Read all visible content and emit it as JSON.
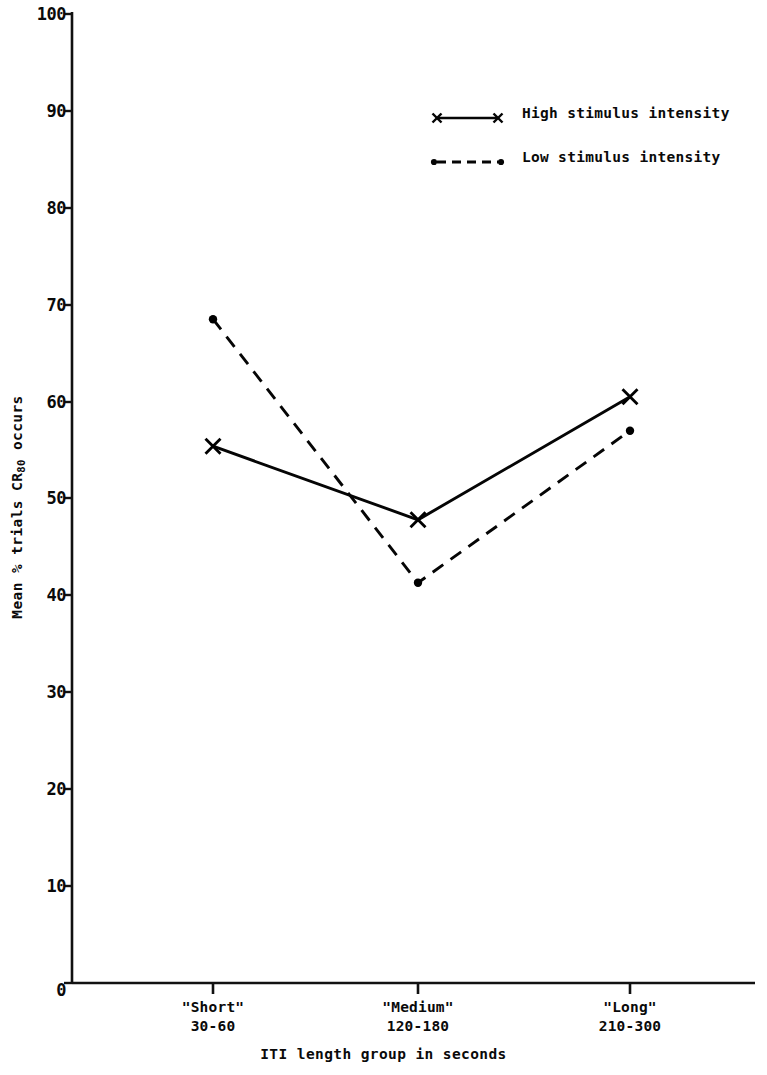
{
  "chart_data": {
    "type": "line",
    "title": "",
    "xlabel": "ITI length group in seconds",
    "ylabel": "Mean % trials CR80 occurs",
    "ylabel_main": "Mean % trials CR",
    "ylabel_sub": "80",
    "ylabel_tail": " occurs",
    "categories": [
      "\"Short\"",
      "\"Medium\"",
      "\"Long\""
    ],
    "category_ranges": [
      "30-60",
      "120-180",
      "210-300"
    ],
    "ylim": [
      0,
      100
    ],
    "yticks": [
      0,
      10,
      20,
      30,
      40,
      50,
      60,
      70,
      80,
      90,
      100
    ],
    "ytick_labels": [
      "0",
      "10",
      "20",
      "30",
      "40",
      "50",
      "60",
      "70",
      "80",
      "90",
      "100"
    ],
    "grid": false,
    "legend_position": "upper right",
    "series": [
      {
        "name": "High stimulus intensity",
        "values": [
          55.4,
          47.8,
          60.5
        ],
        "line_style": "solid",
        "marker": "x",
        "color": "#000000"
      },
      {
        "name": "Low stimulus intensity",
        "values": [
          68.5,
          41.3,
          57.0
        ],
        "line_style": "dashed",
        "marker": "dot",
        "color": "#000000"
      }
    ]
  },
  "legend": {
    "entries": [
      {
        "label": "High stimulus intensity",
        "sample": "solid-x-line-sample"
      },
      {
        "label": "Low stimulus intensity",
        "sample": "dashed-dot-line-sample"
      }
    ]
  },
  "axis": {
    "y_title": "Mean % trials CR",
    "y_title_sub": "80",
    "y_title_tail": " occurs",
    "x_title": "ITI length group in seconds"
  }
}
